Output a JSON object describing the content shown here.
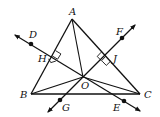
{
  "diagram": {
    "type": "geometry",
    "points": {
      "A": {
        "label": "A",
        "x": 72,
        "y": 19
      },
      "B": {
        "label": "B",
        "x": 31,
        "y": 94
      },
      "C": {
        "label": "C",
        "x": 140,
        "y": 94
      },
      "O": {
        "label": "O",
        "x": 83,
        "y": 77
      },
      "H": {
        "label": "H",
        "x": 51.5,
        "y": 56.5
      },
      "J": {
        "label": "J",
        "x": 106,
        "y": 56.5
      },
      "D": {
        "label": "D",
        "x": 31,
        "y": 44
      },
      "E": {
        "label": "E",
        "x": 124,
        "y": 101
      },
      "F": {
        "label": "F",
        "x": 122,
        "y": 38
      },
      "G": {
        "label": "G",
        "x": 60,
        "y": 100
      }
    },
    "segments": [
      "AB",
      "BC",
      "CA",
      "AO",
      "BO",
      "CO"
    ],
    "lines": [
      {
        "name": "DE",
        "through": [
          "D",
          "H",
          "O",
          "E"
        ],
        "perpendicular_to": "AB",
        "right_angle_at": "H"
      },
      {
        "name": "FG",
        "through": [
          "F",
          "J",
          "O",
          "G"
        ],
        "perpendicular_to": "AC",
        "right_angle_at": "J"
      }
    ],
    "colors": {
      "stroke": "#111111",
      "background": "#ffffff"
    }
  }
}
